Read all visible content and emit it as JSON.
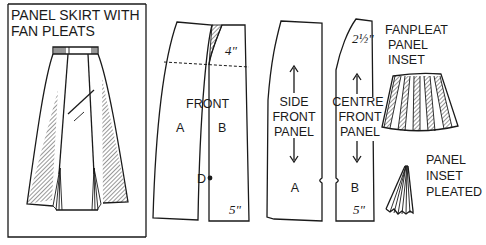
{
  "diagram": {
    "title_lines": [
      "PANEL SKIRT WITH",
      "FAN PLEATS"
    ],
    "front_piece": {
      "label": "FRONT",
      "section_a": "A",
      "section_b": "B",
      "point_d": "D",
      "top_measure": "4\"",
      "hem_measure": "5\""
    },
    "side_front_panel": {
      "label_lines": [
        "SIDE",
        "FRONT",
        "PANEL"
      ],
      "section": "A"
    },
    "centre_front_panel": {
      "label_lines": [
        "CENTRE",
        "FRONT",
        "PANEL"
      ],
      "section": "B",
      "top_measure": "2½\"",
      "hem_measure": "5\""
    },
    "fanpleat_inset": {
      "label_lines": [
        "FANPLEAT",
        "PANEL",
        "INSET"
      ]
    },
    "pleated_inset": {
      "label_lines": [
        "PANEL",
        "INSET",
        "PLEATED"
      ]
    },
    "colors": {
      "ink": "#1a1a1a",
      "paper": "#ffffff"
    }
  }
}
